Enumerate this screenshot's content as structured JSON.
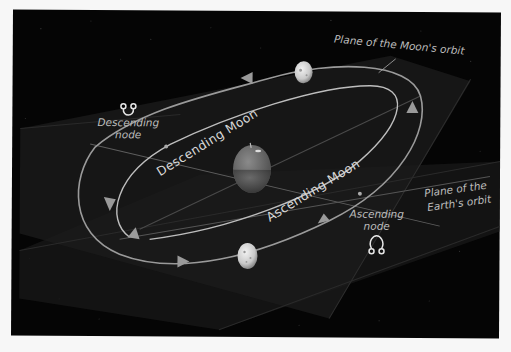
{
  "title": "",
  "diagram": {
    "labels": {
      "moon_plane": "Plane of the Moon's orbit",
      "earth_plane_line1": "Plane of the",
      "earth_plane_line2": "Earth's orbit",
      "descending_node_line1": "Descending",
      "descending_node_line2": "node",
      "ascending_node_line1": "Ascending",
      "ascending_node_line2": "node",
      "descending_moon": "Descending Moon",
      "ascending_moon": "Ascending Moon"
    },
    "symbols": {
      "descending_node": "descending-node-symbol",
      "ascending_node": "ascending-node-symbol"
    },
    "bodies": [
      "Earth",
      "Moon (upper)",
      "Moon (lower)"
    ],
    "colors": {
      "background": "#050505",
      "orbit_line": "#9a9a9a",
      "text": "#bdbdbd",
      "page": "#f7f7f7"
    }
  }
}
